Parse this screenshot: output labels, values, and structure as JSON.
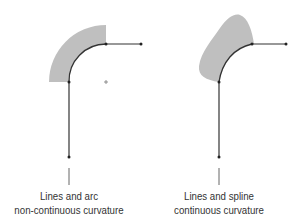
{
  "diagram": {
    "left": {
      "title": "Lines and arc",
      "subtitle": "non-continuous curvature",
      "shape": "lines-and-arc"
    },
    "right": {
      "title": "Lines and spline",
      "subtitle": "continuous curvature",
      "shape": "lines-and-spline"
    },
    "colors": {
      "line": "#333333",
      "fill": "#b5b5b5",
      "background": "#ffffff"
    }
  }
}
